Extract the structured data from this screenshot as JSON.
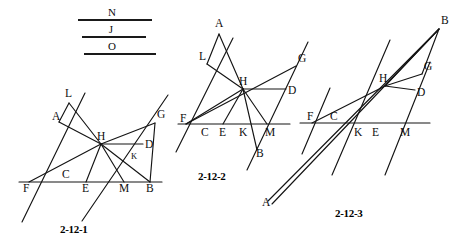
{
  "page": {
    "width": 463,
    "height": 244,
    "background": "#ffffff",
    "ink_color": "#141414"
  },
  "legend": {
    "name": "reference-lines-legend",
    "items": [
      {
        "label": "N",
        "x1": 78,
        "y1": 20,
        "x2": 152,
        "y2": 20,
        "label_x": 112,
        "label_y": 16
      },
      {
        "label": "J",
        "x1": 82,
        "y1": 37,
        "x2": 146,
        "y2": 37,
        "label_x": 111,
        "label_y": 33
      },
      {
        "label": "O",
        "x1": 84,
        "y1": 54,
        "x2": 156,
        "y2": 54,
        "label_x": 112,
        "label_y": 50
      }
    ]
  },
  "figures": [
    {
      "id": "fig-2-12-1",
      "caption": "2-12-1",
      "caption_x": 60,
      "caption_y": 233,
      "points": {
        "L": {
          "x": 69,
          "y": 100,
          "lx": 65,
          "ly": 97,
          "size": "normal"
        },
        "A": {
          "x": 59,
          "y": 122,
          "lx": 52,
          "ly": 120,
          "size": "normal"
        },
        "H": {
          "x": 101,
          "y": 144,
          "lx": 97,
          "ly": 140,
          "size": "normal"
        },
        "G": {
          "x": 155,
          "y": 120,
          "lx": 157,
          "ly": 118,
          "size": "normal"
        },
        "D": {
          "x": 142,
          "y": 145,
          "lx": 145,
          "ly": 148,
          "size": "normal"
        },
        "K": {
          "x": 133,
          "y": 160,
          "lx": 131,
          "ly": 159,
          "size": "small"
        },
        "C": {
          "x": 63,
          "y": 176,
          "lx": 62,
          "ly": 178,
          "size": "normal"
        },
        "F": {
          "x": 29,
          "y": 182,
          "lx": 23,
          "ly": 192,
          "size": "normal"
        },
        "E": {
          "x": 86,
          "y": 182,
          "lx": 82,
          "ly": 192,
          "size": "normal"
        },
        "M": {
          "x": 124,
          "y": 182,
          "lx": 119,
          "ly": 192,
          "size": "normal"
        },
        "B": {
          "x": 150,
          "y": 182,
          "lx": 146,
          "ly": 192,
          "size": "normal"
        }
      },
      "segments": [
        {
          "name": "baseline-FB",
          "x1": 19,
          "y1": 182,
          "x2": 162,
          "y2": 182
        },
        {
          "name": "line-through-F",
          "x1": 22,
          "y1": 222,
          "x2": 85,
          "y2": 93
        },
        {
          "name": "line-through-M",
          "x1": 82,
          "y1": 221,
          "x2": 168,
          "y2": 95
        },
        {
          "name": "seg-L-H",
          "x1": 69,
          "y1": 103,
          "x2": 101,
          "y2": 144
        },
        {
          "name": "seg-L-A",
          "x1": 69,
          "y1": 103,
          "x2": 59,
          "y2": 122
        },
        {
          "name": "seg-A-H",
          "x1": 59,
          "y1": 122,
          "x2": 101,
          "y2": 144
        },
        {
          "name": "seg-F-H",
          "x1": 29,
          "y1": 182,
          "x2": 101,
          "y2": 144
        },
        {
          "name": "seg-H-G",
          "x1": 101,
          "y1": 144,
          "x2": 155,
          "y2": 123
        },
        {
          "name": "seg-H-D",
          "x1": 101,
          "y1": 144,
          "x2": 143,
          "y2": 144
        },
        {
          "name": "seg-H-E",
          "x1": 101,
          "y1": 144,
          "x2": 86,
          "y2": 182
        },
        {
          "name": "seg-H-M",
          "x1": 101,
          "y1": 144,
          "x2": 124,
          "y2": 182
        },
        {
          "name": "seg-H-B",
          "x1": 101,
          "y1": 144,
          "x2": 150,
          "y2": 182
        },
        {
          "name": "seg-G-B",
          "x1": 155,
          "y1": 123,
          "x2": 150,
          "y2": 182
        }
      ]
    },
    {
      "id": "fig-2-12-2",
      "caption": "2-12-2",
      "caption_x": 198,
      "caption_y": 180,
      "points": {
        "A": {
          "x": 219,
          "y": 31,
          "lx": 215,
          "ly": 27,
          "size": "normal"
        },
        "L": {
          "x": 207,
          "y": 62,
          "lx": 199,
          "ly": 60,
          "size": "normal"
        },
        "H": {
          "x": 243,
          "y": 89,
          "lx": 239,
          "ly": 85,
          "size": "normal"
        },
        "G": {
          "x": 296,
          "y": 63,
          "lx": 298,
          "ly": 62,
          "size": "normal"
        },
        "D": {
          "x": 285,
          "y": 90,
          "lx": 288,
          "ly": 94,
          "size": "normal"
        },
        "F": {
          "x": 186,
          "y": 124,
          "lx": 180,
          "ly": 122,
          "size": "normal"
        },
        "C": {
          "x": 205,
          "y": 124,
          "lx": 201,
          "ly": 136,
          "size": "normal"
        },
        "E": {
          "x": 223,
          "y": 124,
          "lx": 219,
          "ly": 136,
          "size": "normal"
        },
        "K": {
          "x": 243,
          "y": 124,
          "lx": 239,
          "ly": 136,
          "size": "normal"
        },
        "M": {
          "x": 267,
          "y": 124,
          "lx": 265,
          "ly": 136,
          "size": "normal"
        },
        "B": {
          "x": 257,
          "y": 152,
          "lx": 256,
          "ly": 157,
          "size": "normal"
        }
      },
      "segments": [
        {
          "name": "baseline-FM",
          "x1": 178,
          "y1": 124,
          "x2": 290,
          "y2": 124
        },
        {
          "name": "line-through-F",
          "x1": 176,
          "y1": 152,
          "x2": 233,
          "y2": 38
        },
        {
          "name": "line-through-M",
          "x1": 247,
          "y1": 170,
          "x2": 308,
          "y2": 42
        },
        {
          "name": "seg-A-L",
          "x1": 219,
          "y1": 34,
          "x2": 207,
          "y2": 64
        },
        {
          "name": "seg-A-H",
          "x1": 219,
          "y1": 34,
          "x2": 243,
          "y2": 89
        },
        {
          "name": "seg-L-H",
          "x1": 207,
          "y1": 64,
          "x2": 243,
          "y2": 89
        },
        {
          "name": "seg-F-H",
          "x1": 186,
          "y1": 124,
          "x2": 243,
          "y2": 89
        },
        {
          "name": "seg-F-G",
          "x1": 186,
          "y1": 124,
          "x2": 296,
          "y2": 66
        },
        {
          "name": "seg-H-D",
          "x1": 243,
          "y1": 89,
          "x2": 286,
          "y2": 89
        },
        {
          "name": "seg-H-E",
          "x1": 243,
          "y1": 89,
          "x2": 223,
          "y2": 124
        },
        {
          "name": "seg-H-M",
          "x1": 243,
          "y1": 89,
          "x2": 267,
          "y2": 124
        },
        {
          "name": "seg-H-B",
          "x1": 243,
          "y1": 89,
          "x2": 257,
          "y2": 150
        }
      ]
    },
    {
      "id": "fig-2-12-3",
      "caption": "2-12-3",
      "caption_x": 335,
      "caption_y": 217,
      "points": {
        "B": {
          "x": 439,
          "y": 26,
          "lx": 441,
          "ly": 24,
          "size": "normal"
        },
        "G": {
          "x": 422,
          "y": 72,
          "lx": 424,
          "ly": 70,
          "size": "normal"
        },
        "H": {
          "x": 385,
          "y": 86,
          "lx": 379,
          "ly": 82,
          "size": "normal"
        },
        "D": {
          "x": 414,
          "y": 93,
          "lx": 417,
          "ly": 96,
          "size": "normal"
        },
        "F": {
          "x": 312,
          "y": 123,
          "lx": 307,
          "ly": 120,
          "size": "normal"
        },
        "C": {
          "x": 333,
          "y": 123,
          "lx": 330,
          "ly": 120,
          "size": "normal"
        },
        "K": {
          "x": 358,
          "y": 123,
          "lx": 354,
          "ly": 136,
          "size": "normal"
        },
        "E": {
          "x": 375,
          "y": 123,
          "lx": 372,
          "ly": 136,
          "size": "normal"
        },
        "M": {
          "x": 404,
          "y": 123,
          "lx": 400,
          "ly": 136,
          "size": "normal"
        },
        "A": {
          "x": 268,
          "y": 204,
          "lx": 262,
          "ly": 206,
          "size": "normal"
        }
      },
      "segments": [
        {
          "name": "baseline-FM",
          "x1": 300,
          "y1": 123,
          "x2": 430,
          "y2": 123
        },
        {
          "name": "line-through-F",
          "x1": 302,
          "y1": 154,
          "x2": 330,
          "y2": 88
        },
        {
          "name": "line-through-K",
          "x1": 332,
          "y1": 175,
          "x2": 390,
          "y2": 40
        },
        {
          "name": "line-through-M",
          "x1": 385,
          "y1": 175,
          "x2": 430,
          "y2": 62
        },
        {
          "name": "seg-A-B",
          "x1": 268,
          "y1": 201,
          "x2": 439,
          "y2": 29
        },
        {
          "name": "seg-A-H-ray",
          "x1": 272,
          "y1": 204,
          "x2": 439,
          "y2": 29
        },
        {
          "name": "seg-F-H",
          "x1": 312,
          "y1": 123,
          "x2": 385,
          "y2": 86
        },
        {
          "name": "seg-H-B",
          "x1": 385,
          "y1": 86,
          "x2": 439,
          "y2": 29
        },
        {
          "name": "seg-H-G",
          "x1": 385,
          "y1": 86,
          "x2": 422,
          "y2": 74
        },
        {
          "name": "seg-H-D",
          "x1": 385,
          "y1": 86,
          "x2": 415,
          "y2": 90
        },
        {
          "name": "seg-G-B",
          "x1": 422,
          "y1": 74,
          "x2": 439,
          "y2": 29
        }
      ]
    }
  ]
}
